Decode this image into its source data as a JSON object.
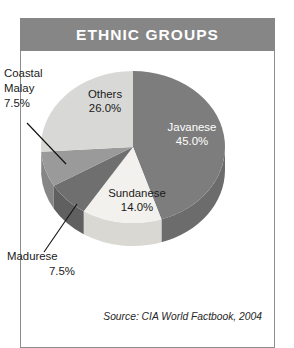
{
  "figure": {
    "title": "ETHNIC GROUPS",
    "source": "Source: CIA World Factbook, 2004"
  },
  "colors": {
    "header_bar": "#868686",
    "card_border": "#8d8d8d",
    "page_background": "#ffffff",
    "javanese": "#7d7d7d",
    "sundanese": "#f2f1ed",
    "madurese": "#6f6f6f",
    "coastal_malay": "#9a9a9a",
    "others": "#d8d8d6"
  },
  "chart_data": {
    "type": "pie",
    "title": "ETHNIC GROUPS",
    "xlabel": "",
    "ylabel": "",
    "legend": "none",
    "three_d": true,
    "start_angle_deg": 0,
    "direction": "clockwise",
    "total_percent": 100.0,
    "categories": [
      "Javanese",
      "Sundanese",
      "Madurese",
      "Coastal Malay",
      "Others"
    ],
    "values": [
      45.0,
      14.0,
      7.5,
      7.5,
      26.0
    ],
    "slices": [
      {
        "name": "Javanese",
        "value": 45.0,
        "label": "Javanese",
        "value_label": "45.0%",
        "color": "#7d7d7d",
        "side_color": "#6c6c6c",
        "label_placement": "inside",
        "label_color": "white"
      },
      {
        "name": "Sundanese",
        "value": 14.0,
        "label": "Sundanese",
        "value_label": "14.0%",
        "color": "#f2f1ed",
        "side_color": "#d9d8d3",
        "label_placement": "inside",
        "label_color": "black"
      },
      {
        "name": "Madurese",
        "value": 7.5,
        "label": "Madurese",
        "value_label": "7.5%",
        "color": "#6f6f6f",
        "side_color": "#606060",
        "label_placement": "callout",
        "label_color": "black"
      },
      {
        "name": "Coastal Malay",
        "value": 7.5,
        "label_line1": "Coastal",
        "label_line2": "Malay",
        "value_label": "7.5%",
        "color": "#9a9a9a",
        "side_color": "#868686",
        "label_placement": "callout",
        "label_color": "black"
      },
      {
        "name": "Others",
        "value": 26.0,
        "label": "Others",
        "value_label": "26.0%",
        "color": "#d8d8d6",
        "side_color": "#bcbcba",
        "label_placement": "inside",
        "label_color": "black"
      }
    ]
  }
}
